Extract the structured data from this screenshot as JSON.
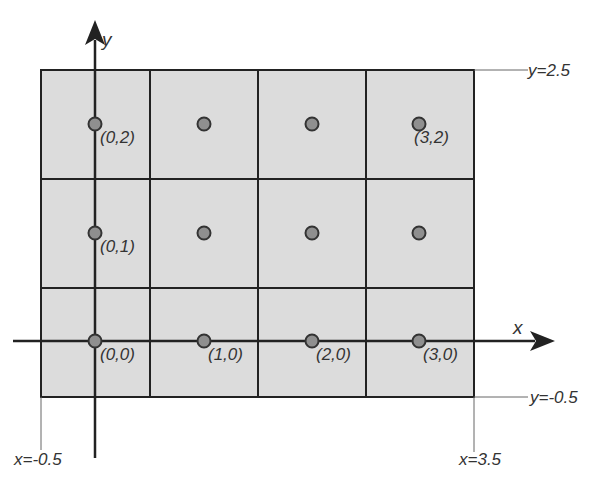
{
  "diagram": {
    "type": "lattice-grid",
    "axes": {
      "x_label": "x",
      "y_label": "y"
    },
    "boundaries": {
      "top": "y=2.5",
      "bottom": "y=-0.5",
      "left": "x=-0.5",
      "right": "x=3.5"
    },
    "grid": {
      "columns": 4,
      "rows": 3,
      "fill_color": "#d9d9d9",
      "line_color": "#222222",
      "dot_color": "#8a8a8a"
    },
    "points": [
      {
        "x": 0,
        "y": 0,
        "label": "(0,0)"
      },
      {
        "x": 1,
        "y": 0,
        "label": "(1,0)"
      },
      {
        "x": 2,
        "y": 0,
        "label": "(2,0)"
      },
      {
        "x": 3,
        "y": 0,
        "label": "(3,0)"
      },
      {
        "x": 0,
        "y": 1,
        "label": "(0,1)"
      },
      {
        "x": 1,
        "y": 1,
        "label": ""
      },
      {
        "x": 2,
        "y": 1,
        "label": ""
      },
      {
        "x": 3,
        "y": 1,
        "label": ""
      },
      {
        "x": 0,
        "y": 2,
        "label": "(0,2)"
      },
      {
        "x": 1,
        "y": 2,
        "label": ""
      },
      {
        "x": 2,
        "y": 2,
        "label": ""
      },
      {
        "x": 3,
        "y": 2,
        "label": "(3,2)"
      }
    ]
  }
}
